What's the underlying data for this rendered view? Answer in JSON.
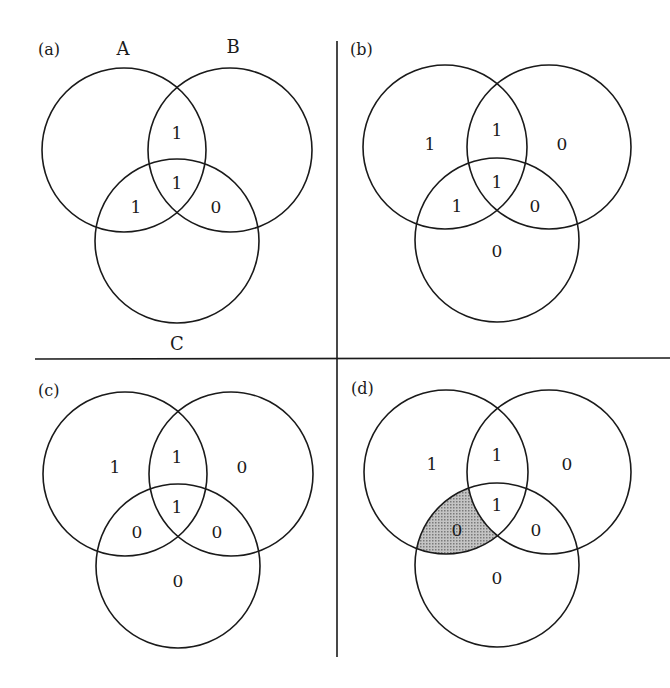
{
  "colors": {
    "line": "#1a1a1a",
    "shade": "#a8a8a8",
    "background": "#ffffff"
  },
  "set_labels": {
    "a": "A",
    "b": "B",
    "c": "C"
  },
  "panels": {
    "a": {
      "label": "(a)",
      "regions": {
        "AB": "1",
        "ABC": "1",
        "AC": "1",
        "BC": "0"
      }
    },
    "b": {
      "label": "(b)",
      "regions": {
        "A": "1",
        "AB": "1",
        "B": "0",
        "ABC": "1",
        "AC": "1",
        "BC": "0",
        "C": "0"
      }
    },
    "c": {
      "label": "(c)",
      "regions": {
        "A": "1",
        "AB": "1",
        "B": "0",
        "ABC": "1",
        "AC": "0",
        "BC": "0",
        "C": "0"
      }
    },
    "d": {
      "label": "(d)",
      "regions": {
        "A": "1",
        "AB": "1",
        "B": "0",
        "ABC": "1",
        "AC": "0",
        "BC": "0",
        "C": "0"
      },
      "shaded_region": "AC"
    }
  }
}
